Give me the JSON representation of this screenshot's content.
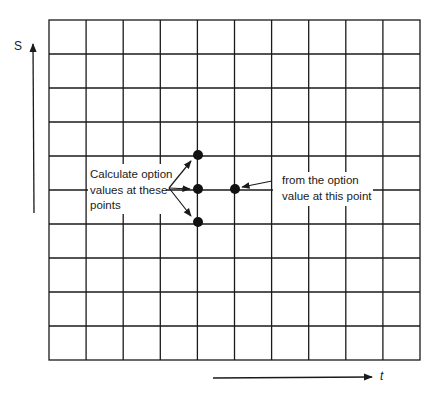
{
  "diagram": {
    "axes": {
      "vertical_label": "S",
      "horizontal_label": "t"
    },
    "grid": {
      "columns": 10,
      "rows": 10,
      "left": 49,
      "top": 20,
      "right": 420,
      "bottom": 360
    },
    "annotations": {
      "left_label_lines": [
        "Calculate option",
        "values at these",
        "points"
      ],
      "right_label_lines": [
        "from the option",
        "value at this point"
      ]
    },
    "points": [
      {
        "name": "upper-target-point",
        "col": 4,
        "row": 4
      },
      {
        "name": "middle-target-point",
        "col": 4,
        "row": 5
      },
      {
        "name": "lower-target-point",
        "col": 4,
        "row": 6
      },
      {
        "name": "source-point",
        "col": 5,
        "row": 5
      }
    ],
    "colors": {
      "line": "#1a1a1a",
      "background": "#ffffff"
    }
  }
}
